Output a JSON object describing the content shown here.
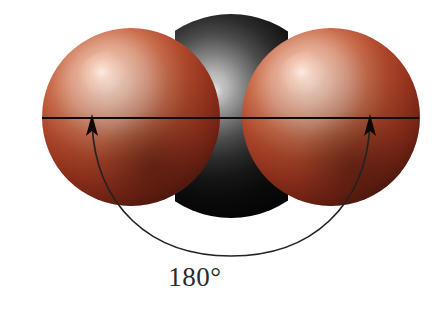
{
  "figure": {
    "background_color": "#ffffff",
    "annotation": {
      "angle_label": "180°",
      "angle_value": 180,
      "angle_units": "degrees",
      "label_color": "#2b2b2b"
    },
    "axis_line": {
      "color": "#1a1008",
      "x_start": 42,
      "x_end": 419,
      "y": 118
    },
    "arrows": [
      {
        "name": "left-arrow",
        "tip_x": 92,
        "tip_y": 117,
        "direction": "up"
      },
      {
        "name": "right-arrow",
        "tip_x": 370,
        "tip_y": 117,
        "direction": "up"
      }
    ],
    "atoms": [
      {
        "name": "oxygen-left",
        "element": "O",
        "color": "#a8381f",
        "highlight_color": "#f2cfc0",
        "shadow_color": "#3d150c",
        "center_x": 131,
        "center_y": 117,
        "radius": 89
      },
      {
        "name": "carbon-center",
        "element": "C",
        "color": "#0b0b0b",
        "highlight_color": "#bdbdbd",
        "shadow_color": "#000000",
        "center_x": 231,
        "center_y": 116,
        "radius": 102
      },
      {
        "name": "oxygen-right",
        "element": "O",
        "color": "#a8381f",
        "highlight_color": "#f2cfc0",
        "shadow_color": "#3d150c",
        "center_x": 331,
        "center_y": 117,
        "radius": 89
      }
    ],
    "arc": {
      "name": "bond-angle-arc",
      "color": "#23201e",
      "start_x": 92,
      "start_y": 122,
      "end_x": 370,
      "end_y": 122,
      "bottom_y": 256
    }
  }
}
